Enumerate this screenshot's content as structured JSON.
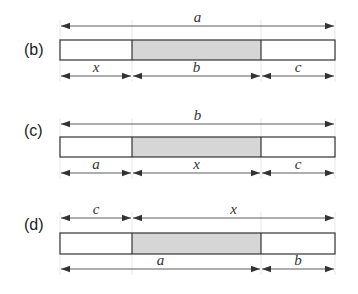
{
  "colors": {
    "stroke": "#333333",
    "fill_shaded": "#d6d6d6",
    "fill_plain": "#ffffff",
    "guide": "#dddddd"
  },
  "layout": {
    "left": 60,
    "div1": 132,
    "div2": 261,
    "right": 335
  },
  "panels": [
    {
      "label": "(b)",
      "label_y": 49,
      "top_arrow_y": 26,
      "box_top": 40,
      "box_bottom": 60,
      "bottom_arrow_y": 76,
      "top_dims": [
        {
          "from": "left",
          "to": "right",
          "label": "a"
        }
      ],
      "bottom_dims": [
        {
          "from": "left",
          "to": "div1",
          "label": "x"
        },
        {
          "from": "div1",
          "to": "div2",
          "label": "b"
        },
        {
          "from": "div2",
          "to": "right",
          "label": "c"
        }
      ]
    },
    {
      "label": "(c)",
      "label_y": 130,
      "top_arrow_y": 124,
      "box_top": 137,
      "box_bottom": 157,
      "bottom_arrow_y": 173,
      "top_dims": [
        {
          "from": "left",
          "to": "right",
          "label": "b"
        }
      ],
      "bottom_dims": [
        {
          "from": "left",
          "to": "div1",
          "label": "a"
        },
        {
          "from": "div1",
          "to": "div2",
          "label": "x"
        },
        {
          "from": "div2",
          "to": "right",
          "label": "c"
        }
      ]
    },
    {
      "label": "(d)",
      "label_y": 224,
      "top_arrow_y": 218,
      "box_top": 233,
      "box_bottom": 254,
      "bottom_arrow_y": 269,
      "top_dims": [
        {
          "from": "left",
          "to": "div1",
          "label": "c"
        },
        {
          "from": "div1",
          "to": "right",
          "label": "x"
        }
      ],
      "bottom_dims": [
        {
          "from": "left",
          "to": "div2",
          "label": "a"
        },
        {
          "from": "div2",
          "to": "right",
          "label": "b"
        }
      ]
    }
  ]
}
